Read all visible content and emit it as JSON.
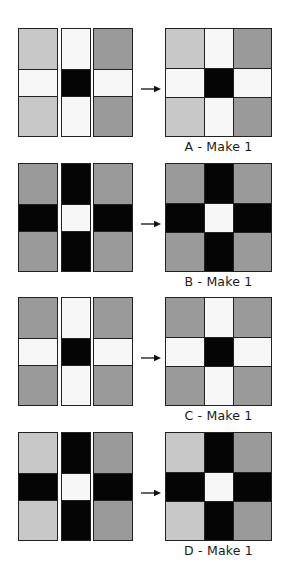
{
  "colors": {
    "light": "#c8c8c8",
    "dark": "#9a9a9a",
    "white": "#f7f7f7",
    "black": "#050505"
  },
  "units": [
    {
      "id": "A",
      "label": "A - Make 1",
      "left_strip": [
        "light",
        "white",
        "light"
      ],
      "mid_strip": [
        "white",
        "black",
        "white"
      ],
      "right_strip": [
        "dark",
        "white",
        "dark"
      ]
    },
    {
      "id": "B",
      "label": "B - Make 1",
      "left_strip": [
        "dark",
        "black",
        "dark"
      ],
      "mid_strip": [
        "black",
        "white",
        "black"
      ],
      "right_strip": [
        "dark",
        "black",
        "dark"
      ]
    },
    {
      "id": "C",
      "label": "C - Make 1",
      "left_strip": [
        "dark",
        "white",
        "dark"
      ],
      "mid_strip": [
        "white",
        "black",
        "white"
      ],
      "right_strip": [
        "dark",
        "white",
        "dark"
      ]
    },
    {
      "id": "D",
      "label": "D - Make 1",
      "left_strip": [
        "light",
        "black",
        "light"
      ],
      "mid_strip": [
        "black",
        "white",
        "black"
      ],
      "right_strip": [
        "dark",
        "black",
        "dark"
      ]
    }
  ],
  "arrow_icon": "right-arrow-icon"
}
